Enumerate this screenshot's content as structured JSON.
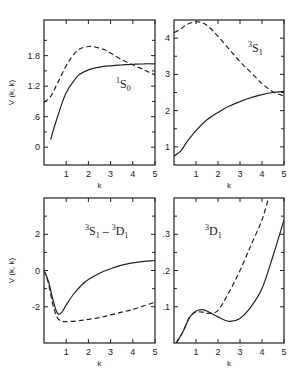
{
  "chart_data": [
    {
      "type": "line",
      "panel": "top-left",
      "annotation": {
        "sup": "1",
        "main": "S",
        "sub": "0"
      },
      "xlabel": "k",
      "ylabel": "V (k, k)",
      "xlim": [
        0,
        5
      ],
      "ylim": [
        -0.35,
        2.5
      ],
      "xticks": [
        "1",
        "2",
        "3",
        "4",
        "5"
      ],
      "yticks": [
        "0",
        ".6",
        "1.2",
        "1.8"
      ],
      "ytick_values": [
        0,
        0.6,
        1.2,
        1.8
      ],
      "series": [
        {
          "name": "solid",
          "style": "solid",
          "x": [
            0.3,
            0.5,
            0.8,
            1.0,
            1.3,
            1.6,
            2.0,
            2.3,
            2.7,
            3.0,
            3.5,
            4.0,
            4.5,
            5.0
          ],
          "y": [
            0.15,
            0.45,
            0.85,
            1.07,
            1.28,
            1.43,
            1.52,
            1.56,
            1.59,
            1.6,
            1.62,
            1.63,
            1.64,
            1.64
          ]
        },
        {
          "name": "dashed",
          "style": "dashed",
          "x": [
            0.0,
            0.3,
            0.6,
            1.0,
            1.3,
            1.6,
            2.0,
            2.3,
            2.7,
            3.0,
            3.5,
            4.0,
            4.5,
            5.0
          ],
          "y": [
            0.88,
            1.0,
            1.25,
            1.6,
            1.8,
            1.93,
            1.98,
            1.97,
            1.92,
            1.85,
            1.72,
            1.62,
            1.52,
            1.42
          ]
        }
      ]
    },
    {
      "type": "line",
      "panel": "top-right",
      "annotation": {
        "sup": "3",
        "main": "S",
        "sub": "1"
      },
      "xlabel": "k",
      "ylabel": "",
      "xlim": [
        0,
        5
      ],
      "ylim": [
        0.5,
        4.5
      ],
      "xticks": [
        "1",
        "2",
        "3",
        "4",
        "5"
      ],
      "yticks": [
        "1",
        "2",
        "3",
        "4"
      ],
      "ytick_values": [
        1,
        2,
        3,
        4
      ],
      "series": [
        {
          "name": "solid",
          "style": "solid",
          "x": [
            0.0,
            0.3,
            0.6,
            1.0,
            1.5,
            2.0,
            2.5,
            3.0,
            3.5,
            4.0,
            4.5,
            5.0
          ],
          "y": [
            0.75,
            0.88,
            1.15,
            1.45,
            1.75,
            1.95,
            2.12,
            2.25,
            2.36,
            2.44,
            2.5,
            2.53
          ]
        },
        {
          "name": "dashed",
          "style": "dashed",
          "x": [
            0.0,
            0.3,
            0.6,
            1.0,
            1.3,
            1.6,
            2.0,
            2.5,
            3.0,
            3.5,
            4.0,
            4.5,
            5.0
          ],
          "y": [
            4.15,
            4.25,
            4.38,
            4.45,
            4.42,
            4.3,
            4.05,
            3.7,
            3.35,
            3.05,
            2.75,
            2.52,
            2.4
          ]
        }
      ]
    },
    {
      "type": "line",
      "panel": "bottom-left",
      "annotation": {
        "sup1": "3",
        "main1": "S",
        "sub1": "1",
        "dash": " – ",
        "sup2": "3",
        "main2": "D",
        "sub2": "1"
      },
      "xlabel": "k",
      "ylabel": "V (k, k)",
      "xlim": [
        0,
        5
      ],
      "ylim": [
        -4.0,
        4.0
      ],
      "xticks": [
        "1",
        "2",
        "3",
        "4",
        "5"
      ],
      "yticks": [
        "-2",
        "0",
        "2"
      ],
      "ytick_values": [
        -2,
        0,
        2
      ],
      "series": [
        {
          "name": "solid",
          "style": "solid",
          "x": [
            0.0,
            0.2,
            0.4,
            0.6,
            0.8,
            1.0,
            1.3,
            1.7,
            2.0,
            2.5,
            3.0,
            3.5,
            4.0,
            4.5,
            5.0
          ],
          "y": [
            0.0,
            -0.6,
            -1.6,
            -2.35,
            -2.3,
            -1.9,
            -1.35,
            -0.8,
            -0.5,
            -0.15,
            0.1,
            0.3,
            0.42,
            0.5,
            0.55
          ]
        },
        {
          "name": "dashed",
          "style": "dashed",
          "x": [
            0.0,
            0.2,
            0.4,
            0.6,
            0.8,
            1.0,
            1.5,
            2.0,
            2.5,
            3.0,
            3.5,
            4.0,
            4.5,
            5.0
          ],
          "y": [
            0.0,
            -0.7,
            -1.9,
            -2.6,
            -2.8,
            -2.82,
            -2.78,
            -2.7,
            -2.6,
            -2.45,
            -2.3,
            -2.15,
            -1.95,
            -1.75
          ]
        }
      ]
    },
    {
      "type": "line",
      "panel": "bottom-right",
      "annotation": {
        "sup": "3",
        "main": "D",
        "sub": "1"
      },
      "xlabel": "k",
      "ylabel": "",
      "xlim": [
        0,
        5
      ],
      "ylim": [
        0.0,
        0.4
      ],
      "xticks": [
        "1",
        "2",
        "3",
        "4",
        "5"
      ],
      "yticks": [
        ".1",
        ".2",
        ".3"
      ],
      "ytick_values": [
        0.1,
        0.2,
        0.3
      ],
      "series": [
        {
          "name": "solid",
          "style": "solid",
          "x": [
            0.1,
            0.4,
            0.7,
            1.0,
            1.3,
            1.6,
            2.0,
            2.5,
            3.0,
            3.5,
            4.0,
            4.5,
            5.0
          ],
          "y": [
            0.0,
            0.03,
            0.07,
            0.088,
            0.092,
            0.085,
            0.072,
            0.06,
            0.068,
            0.1,
            0.15,
            0.24,
            0.34
          ]
        },
        {
          "name": "dashed",
          "style": "dashed",
          "x": [
            0.1,
            0.4,
            0.7,
            1.0,
            1.3,
            1.6,
            2.0,
            2.5,
            3.0,
            3.5,
            4.0,
            4.3
          ],
          "y": [
            0.0,
            0.03,
            0.07,
            0.085,
            0.085,
            0.082,
            0.09,
            0.14,
            0.2,
            0.27,
            0.34,
            0.4
          ]
        }
      ]
    }
  ]
}
